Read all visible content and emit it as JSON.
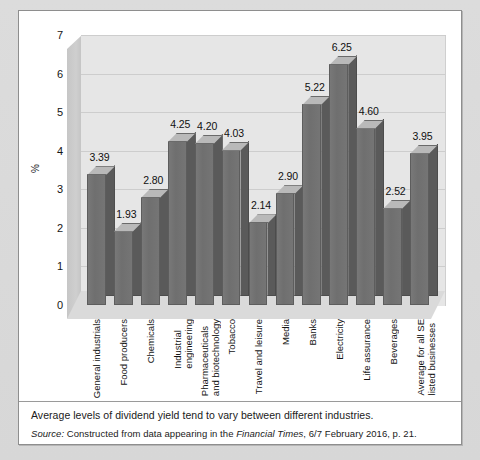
{
  "chart_data": {
    "type": "bar",
    "title": "",
    "xlabel": "",
    "ylabel": "%",
    "ylim": [
      0,
      7
    ],
    "yticks": [
      7,
      6,
      5,
      4,
      3,
      2,
      1,
      0
    ],
    "grid": true,
    "legend": "none",
    "style": "3d-column",
    "categories": [
      "General industrials",
      "Food producers",
      "Chemicals",
      "Industrial engineering",
      "Pharmaceuticals and biotechnology",
      "Tobacco",
      "Travel and leisure",
      "Media",
      "Banks",
      "Electricity",
      "Life assurance",
      "Beverages",
      "Average for all SE listed businesses"
    ],
    "category_lines": [
      [
        "General industrials"
      ],
      [
        "Food producers"
      ],
      [
        "Chemicals"
      ],
      [
        "Industrial",
        "engineering"
      ],
      [
        "Pharmaceuticals",
        "and biotechnology"
      ],
      [
        "Tobacco"
      ],
      [
        "Travel and leisure"
      ],
      [
        "Media"
      ],
      [
        "Banks"
      ],
      [
        "Electricity"
      ],
      [
        "Life assurance"
      ],
      [
        "Beverages"
      ],
      [
        "Average for all SE",
        "listed businesses"
      ]
    ],
    "values": [
      3.39,
      1.93,
      2.8,
      4.25,
      4.2,
      4.03,
      2.14,
      2.9,
      5.22,
      6.25,
      4.6,
      2.52,
      3.95
    ],
    "value_labels": [
      "3.39",
      "1.93",
      "2.80",
      "4.25",
      "4.20",
      "4.03",
      "2.14",
      "2.90",
      "5.22",
      "6.25",
      "4.60",
      "2.52",
      "3.95"
    ]
  },
  "colors": {
    "bar_front": "#757575",
    "bar_side": "#5a5a5a",
    "bar_top": "#b9b9b9",
    "plot_back": "#e6e6e6",
    "plot_floor": "#dadada",
    "gridline": "#cdcdcd",
    "panel": "#ffffff",
    "page": "#d9d9d9",
    "text": "#141414"
  },
  "caption": {
    "main": "Average levels of dividend yield tend to vary between different industries.",
    "source_prefix": "Source:",
    "source_text_a": "Constructed from data appearing in the",
    "source_publication": "Financial Times",
    "source_text_b": ", 6/7 February 2016, p. 21."
  }
}
